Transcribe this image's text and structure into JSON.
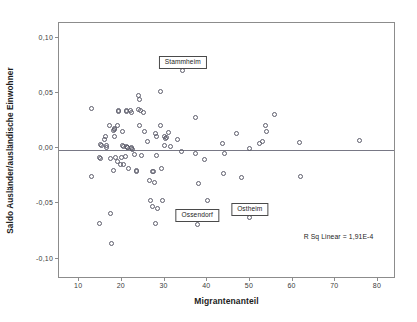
{
  "chart_data": {
    "type": "scatter",
    "title": "",
    "xlabel": "Migrantenanteil",
    "ylabel": "Saldo Ausländer/ausländische Einwohner",
    "xlim": [
      5.5,
      84.0
    ],
    "ylim": [
      -0.1175,
      0.1125
    ],
    "grid": false,
    "legend": null,
    "xticks": [
      10,
      20,
      30,
      40,
      50,
      60,
      70,
      80
    ],
    "xtick_labels": [
      "10",
      "20",
      "30",
      "40",
      "50",
      "60",
      "70",
      "80"
    ],
    "yticks": [
      0.1,
      0.05,
      0.0,
      -0.05,
      -0.1
    ],
    "ytick_labels": [
      "0,10",
      "0,05",
      "0,00",
      "-0,05",
      "-0,10"
    ],
    "annotations": [
      {
        "text": "Stammheim",
        "point_x": 34.5,
        "point_y": 0.0697,
        "box_x": 34.5,
        "box_y": 0.0785
      },
      {
        "text": "Ossendorf",
        "point_x": 37.9,
        "point_y": -0.0697,
        "box_x": 37.9,
        "box_y": -0.0608
      },
      {
        "text": "Ostheim",
        "point_x": 50.2,
        "point_y": -0.0637,
        "box_x": 50.2,
        "box_y": -0.0547
      }
    ],
    "fit_line": {
      "label": "R Sq Linear = 1,91E-4",
      "type": "linear",
      "y_at_xmin": -0.0022,
      "y_at_xmax": -0.0022,
      "label_x": 71.0,
      "label_y": -0.0805
    },
    "series": [
      {
        "name": "Stadtteile",
        "marker": "open-circle",
        "color": "#5d5d6b",
        "points": [
          [
            13.2,
            0.0352
          ],
          [
            13.1,
            -0.0262
          ],
          [
            15.0,
            -0.0095
          ],
          [
            15.2,
            -0.0098
          ],
          [
            15.4,
            0.0012
          ],
          [
            15.3,
            0.0021
          ],
          [
            15.1,
            -0.069
          ],
          [
            16.1,
            0.0072
          ],
          [
            16.5,
            0.0095
          ],
          [
            16.7,
            0.0018
          ],
          [
            16.6,
            -0.0003
          ],
          [
            17.4,
            0.02
          ],
          [
            17.5,
            -0.0102
          ],
          [
            17.6,
            -0.0597
          ],
          [
            17.9,
            -0.0873
          ],
          [
            18.3,
            0.0155
          ],
          [
            18.4,
            0.0168
          ],
          [
            18.5,
            0.016
          ],
          [
            18.6,
            0.0095
          ],
          [
            18.7,
            -0.0094
          ],
          [
            18.2,
            -0.0211
          ],
          [
            19.3,
            0.0197
          ],
          [
            19.4,
            0.0323
          ],
          [
            19.5,
            0.0331
          ],
          [
            19.2,
            -0.0126
          ],
          [
            19.8,
            -0.0154
          ],
          [
            20.3,
            0.0141
          ],
          [
            20.4,
            0.0013
          ],
          [
            20.5,
            0.0003
          ],
          [
            20.1,
            -0.0093
          ],
          [
            20.6,
            -0.016
          ],
          [
            21.3,
            0.033
          ],
          [
            21.4,
            0.0328
          ],
          [
            21.2,
            0.0003
          ],
          [
            21.5,
            0.0
          ],
          [
            21.6,
            -0.0006
          ],
          [
            21.1,
            -0.0088
          ],
          [
            21.7,
            -0.0196
          ],
          [
            22.3,
            0.0335
          ],
          [
            22.6,
            0.0311
          ],
          [
            22.4,
            0.0
          ],
          [
            22.5,
            -0.0015
          ],
          [
            22.7,
            -0.0023
          ],
          [
            23.1,
            -0.0066
          ],
          [
            23.6,
            -0.0212
          ],
          [
            23.7,
            -0.022
          ],
          [
            24.2,
            0.047
          ],
          [
            24.4,
            0.0432
          ],
          [
            24.1,
            0.034
          ],
          [
            24.5,
            0.033
          ],
          [
            24.3,
            0.0201
          ],
          [
            24.8,
            -0.0072
          ],
          [
            25.3,
            0.0313
          ],
          [
            25.6,
            0.0141
          ],
          [
            26.3,
            0.0053
          ],
          [
            26.6,
            -0.0297
          ],
          [
            26.9,
            -0.0486
          ],
          [
            27.4,
            -0.0221
          ],
          [
            27.6,
            -0.0224
          ],
          [
            27.8,
            -0.0321
          ],
          [
            27.5,
            -0.054
          ],
          [
            28.2,
            0.0127
          ],
          [
            28.4,
            0.0097
          ],
          [
            28.3,
            -0.0072
          ],
          [
            28.6,
            -0.0559
          ],
          [
            28.1,
            -0.0692
          ],
          [
            29.3,
            0.0196
          ],
          [
            29.4,
            0.0506
          ],
          [
            29.6,
            -0.0196
          ],
          [
            29.8,
            -0.048
          ],
          [
            30.3,
            0.0099
          ],
          [
            30.5,
            0.0083
          ],
          [
            30.8,
            0.0086
          ],
          [
            30.2,
            0.0016
          ],
          [
            31.2,
            0.0131
          ],
          [
            31.6,
            0.0003
          ],
          [
            33.2,
            0.0071
          ],
          [
            34.1,
            -0.0035
          ],
          [
            34.5,
            0.0697
          ],
          [
            37.4,
            0.0273
          ],
          [
            37.9,
            -0.0697
          ],
          [
            37.6,
            -0.0054
          ],
          [
            38.2,
            -0.0327
          ],
          [
            39.6,
            -0.0109
          ],
          [
            40.4,
            -0.0481
          ],
          [
            43.9,
            0.0036
          ],
          [
            44.2,
            -0.0059
          ],
          [
            44.1,
            -0.024
          ],
          [
            47.0,
            0.012
          ],
          [
            48.2,
            -0.0274
          ],
          [
            50.1,
            -0.0013
          ],
          [
            50.2,
            -0.0637
          ],
          [
            52.4,
            0.0032
          ],
          [
            53.2,
            0.0048
          ],
          [
            54.0,
            0.0196
          ],
          [
            54.2,
            0.0142
          ],
          [
            56.0,
            0.0296
          ],
          [
            61.9,
            0.0039
          ],
          [
            62.0,
            -0.0261
          ],
          [
            75.8,
            0.0062
          ]
        ]
      }
    ]
  }
}
